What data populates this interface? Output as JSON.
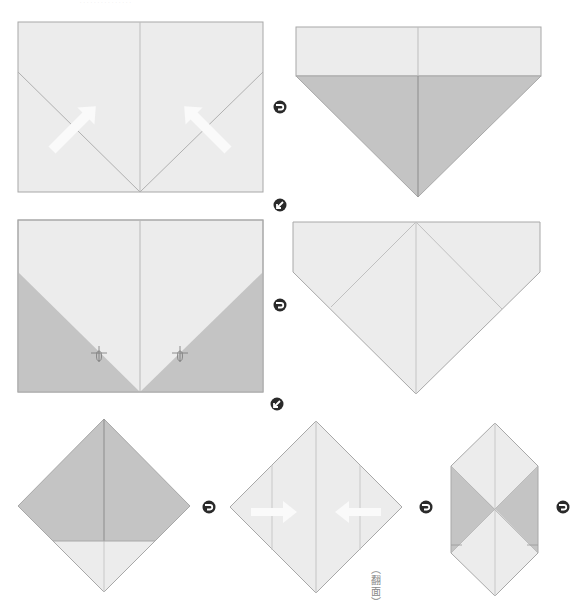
{
  "page": {
    "header_text": "· · · · · · · · · · · · · · ·"
  },
  "colors": {
    "paper_light": "#ececec",
    "paper_dark": "#c4c4c4",
    "crease_line": "#bdbdbd",
    "edge_line": "#a8a8a8",
    "fold_arrow": "#fafafa",
    "step_icon": "#2a2a2a"
  },
  "steps": [
    {
      "id": 1,
      "shape": "rectangle",
      "description": "Fold bottom corners up along diagonal creases",
      "arrows": [
        "up-right",
        "up-left"
      ]
    },
    {
      "id": 2,
      "shape": "pentagon-down",
      "description": "Bottom corners folded up, shaded triangles shown"
    },
    {
      "id": 3,
      "shape": "rectangle",
      "description": "Shaded triangles at bottom with pinch marks",
      "marks": [
        "pinch-left",
        "pinch-right"
      ]
    },
    {
      "id": 4,
      "shape": "pentagon-down",
      "description": "Light pentagon with diagonal creases"
    },
    {
      "id": 5,
      "shape": "diamond",
      "description": "Diamond with shaded top, light bottom triangle"
    },
    {
      "id": 6,
      "shape": "diamond",
      "description": "Fold sides to center",
      "arrows": [
        "right",
        "left"
      ],
      "note": "翻面"
    },
    {
      "id": 7,
      "shape": "hexagon",
      "description": "Hexagonal result with shaded side triangles"
    }
  ],
  "step_arrows": [
    {
      "type": "next",
      "direction": "right"
    },
    {
      "type": "next",
      "direction": "down-left"
    },
    {
      "type": "next",
      "direction": "right"
    },
    {
      "type": "next",
      "direction": "down-left"
    },
    {
      "type": "next",
      "direction": "right"
    },
    {
      "type": "next",
      "direction": "right"
    },
    {
      "type": "next",
      "direction": "right"
    }
  ],
  "flip_note": "（翻面）",
  "flip_note_chars": [
    "︵",
    "翻",
    "面",
    "︶"
  ]
}
